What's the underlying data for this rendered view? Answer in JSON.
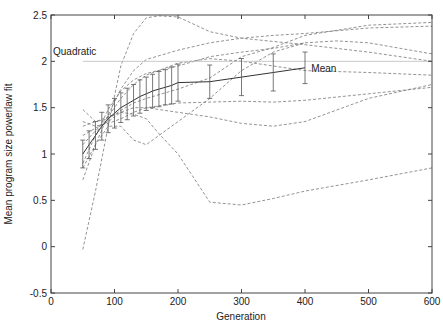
{
  "chart_data": {
    "type": "line",
    "title": "",
    "xlabel": "Generation",
    "ylabel": "Mean program size powerlaw fit",
    "xlim": [
      0,
      600
    ],
    "ylim": [
      -0.5,
      2.5
    ],
    "xticks": [
      0,
      100,
      200,
      300,
      400,
      500,
      600
    ],
    "yticks": [
      -0.5,
      0,
      0.5,
      1,
      1.5,
      2,
      2.5
    ],
    "xtick_labels": [
      "0",
      "100",
      "200",
      "300",
      "400",
      "500",
      "600"
    ],
    "ytick_labels": [
      "-0.5",
      "0",
      "0.5",
      "1",
      "1.5",
      "2",
      "2.5"
    ],
    "grid": false,
    "reference_line": {
      "label": "Quadratic",
      "y": 2.0,
      "x_start": 50,
      "x_end": 600,
      "color": "#bbbbbb"
    },
    "mean_series": {
      "name": "Mean",
      "x": [
        50,
        60,
        70,
        80,
        90,
        100,
        110,
        120,
        130,
        140,
        150,
        160,
        170,
        180,
        190,
        200,
        250,
        300,
        350,
        400
      ],
      "y": [
        1.0,
        1.1,
        1.2,
        1.3,
        1.38,
        1.44,
        1.5,
        1.54,
        1.58,
        1.62,
        1.65,
        1.68,
        1.7,
        1.72,
        1.74,
        1.77,
        1.78,
        1.83,
        1.88,
        1.93
      ],
      "err": [
        0.15,
        0.15,
        0.15,
        0.15,
        0.15,
        0.16,
        0.16,
        0.17,
        0.17,
        0.18,
        0.18,
        0.18,
        0.19,
        0.19,
        0.2,
        0.2,
        0.18,
        0.2,
        0.2,
        0.17
      ],
      "color": "#333333"
    },
    "series": [
      {
        "name": "run-1",
        "x": [
          50,
          70,
          90,
          110,
          130,
          150,
          170,
          200,
          250,
          300,
          400,
          500,
          600
        ],
        "y": [
          -0.03,
          0.6,
          1.3,
          1.95,
          2.3,
          2.47,
          2.49,
          2.48,
          2.32,
          2.25,
          2.18,
          2.1,
          2.0
        ]
      },
      {
        "name": "run-2",
        "x": [
          50,
          70,
          90,
          110,
          130,
          150,
          200,
          250,
          300,
          350,
          400,
          500,
          600
        ],
        "y": [
          0.72,
          1.1,
          1.42,
          1.7,
          1.9,
          2.02,
          2.12,
          2.2,
          2.25,
          2.28,
          2.3,
          2.36,
          2.38
        ]
      },
      {
        "name": "run-3",
        "x": [
          50,
          70,
          90,
          110,
          130,
          150,
          200,
          250,
          300,
          350,
          400,
          450,
          500,
          600
        ],
        "y": [
          0.9,
          1.2,
          1.48,
          1.68,
          1.8,
          1.87,
          1.95,
          2.05,
          2.1,
          2.14,
          2.2,
          2.22,
          2.2,
          2.08
        ]
      },
      {
        "name": "run-4",
        "x": [
          50,
          70,
          90,
          110,
          130,
          150,
          200,
          250,
          300,
          350,
          400,
          500,
          600
        ],
        "y": [
          1.48,
          1.35,
          1.38,
          1.47,
          1.55,
          1.6,
          1.7,
          1.82,
          2.05,
          2.15,
          2.28,
          2.39,
          2.42
        ]
      },
      {
        "name": "run-5",
        "x": [
          50,
          70,
          90,
          110,
          130,
          150,
          200,
          250,
          300,
          350,
          400,
          500,
          600
        ],
        "y": [
          1.35,
          1.3,
          1.33,
          1.38,
          1.45,
          1.5,
          1.55,
          1.56,
          1.57,
          1.56,
          1.58,
          1.65,
          1.72
        ]
      },
      {
        "name": "run-6",
        "x": [
          50,
          70,
          90,
          110,
          130,
          150,
          200,
          250,
          300,
          350,
          400,
          500,
          600
        ],
        "y": [
          1.2,
          1.28,
          1.35,
          1.45,
          1.5,
          1.5,
          1.45,
          1.4,
          1.33,
          1.3,
          1.35,
          1.6,
          1.75
        ]
      },
      {
        "name": "run-7",
        "x": [
          50,
          70,
          90,
          110,
          130,
          150,
          170,
          200,
          250,
          300,
          350,
          400,
          500,
          600
        ],
        "y": [
          1.3,
          1.35,
          1.4,
          1.45,
          1.43,
          1.38,
          1.22,
          1.0,
          0.48,
          0.45,
          0.52,
          0.6,
          0.72,
          0.85
        ]
      },
      {
        "name": "run-8",
        "x": [
          50,
          70,
          90,
          110,
          130,
          150,
          170,
          200,
          250,
          300,
          350,
          400
        ],
        "y": [
          0.85,
          1.1,
          1.3,
          1.3,
          1.15,
          1.1,
          1.2,
          1.35,
          1.6,
          1.9,
          2.1,
          2.2
        ]
      },
      {
        "name": "run-9",
        "x": [
          50,
          70,
          90,
          110,
          130,
          150,
          200,
          250,
          300,
          350,
          400,
          500,
          600
        ],
        "y": [
          1.1,
          1.25,
          1.4,
          1.6,
          1.75,
          1.85,
          1.98,
          2.03,
          2.0,
          1.95,
          1.9,
          1.88,
          1.85
        ]
      }
    ],
    "annotations": [
      {
        "text": "Quadratic",
        "x": 5,
        "y": 2.03
      },
      {
        "text": "Mean",
        "x": 410,
        "y": 1.93
      }
    ],
    "series_style": {
      "color": "#777777",
      "dash": "3,2"
    }
  }
}
